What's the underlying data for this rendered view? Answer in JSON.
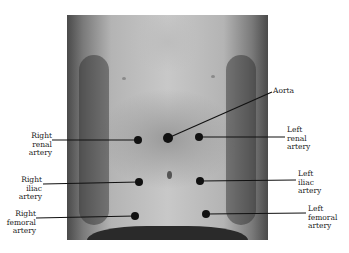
{
  "diagram": {
    "labels": {
      "aorta": "Aorta",
      "right_renal": [
        "Right",
        "renal",
        "artery"
      ],
      "left_renal": [
        "Left",
        "renal",
        "artery"
      ],
      "right_iliac": [
        "Right",
        "iliac",
        "artery"
      ],
      "left_iliac": [
        "Left",
        "iliac",
        "artery"
      ],
      "right_femoral": [
        "Right",
        "femoral",
        "artery"
      ],
      "left_femoral": [
        "Left",
        "femoral",
        "artery"
      ]
    },
    "points": [
      {
        "name": "aorta",
        "x": 168,
        "y": 138
      },
      {
        "name": "right-renal",
        "x": 138,
        "y": 140
      },
      {
        "name": "left-renal",
        "x": 199,
        "y": 137
      },
      {
        "name": "right-iliac",
        "x": 139,
        "y": 182
      },
      {
        "name": "left-iliac",
        "x": 200,
        "y": 181
      },
      {
        "name": "right-femoral",
        "x": 135,
        "y": 216
      },
      {
        "name": "left-femoral",
        "x": 206,
        "y": 214
      }
    ]
  }
}
